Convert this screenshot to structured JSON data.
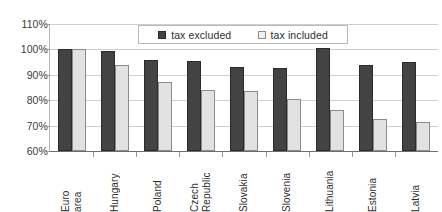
{
  "chart_data": {
    "type": "bar",
    "title": "",
    "subtitle": "",
    "xlabel": "",
    "ylabel": "",
    "ylim": [
      60,
      110
    ],
    "ytick_labels": [
      "110%",
      "100%",
      "90%",
      "80%",
      "70%",
      "60%"
    ],
    "ytick_values": [
      110,
      100,
      90,
      80,
      70,
      60
    ],
    "grid": true,
    "legend_position": "top-center",
    "categories": [
      "Euro area",
      "Hungary",
      "Poland",
      "Czech Republic",
      "Slovakia",
      "Slovenia",
      "Lithuania",
      "Estonia",
      "Latvia"
    ],
    "category_lines": [
      [
        "Euro",
        "area"
      ],
      [
        "Hungary"
      ],
      [
        "Poland"
      ],
      [
        "Czech",
        "Republic"
      ],
      [
        "Slovakia"
      ],
      [
        "Slovenia"
      ],
      [
        "Lithuania"
      ],
      [
        "Estonia"
      ],
      [
        "Latvia"
      ]
    ],
    "series": [
      {
        "name": "tax excluded",
        "color": "#434343",
        "values": [
          100,
          99.5,
          96,
          95.5,
          93,
          92.5,
          100.5,
          94,
          95
        ]
      },
      {
        "name": "tax included",
        "color": "#e2e2e2",
        "values": [
          100,
          94,
          87,
          84,
          83.5,
          80.5,
          76,
          72.5,
          71.5
        ]
      }
    ]
  },
  "legend": {
    "entries": [
      {
        "label": "tax excluded",
        "swatch": "dark"
      },
      {
        "label": "tax included",
        "swatch": "light"
      }
    ]
  }
}
